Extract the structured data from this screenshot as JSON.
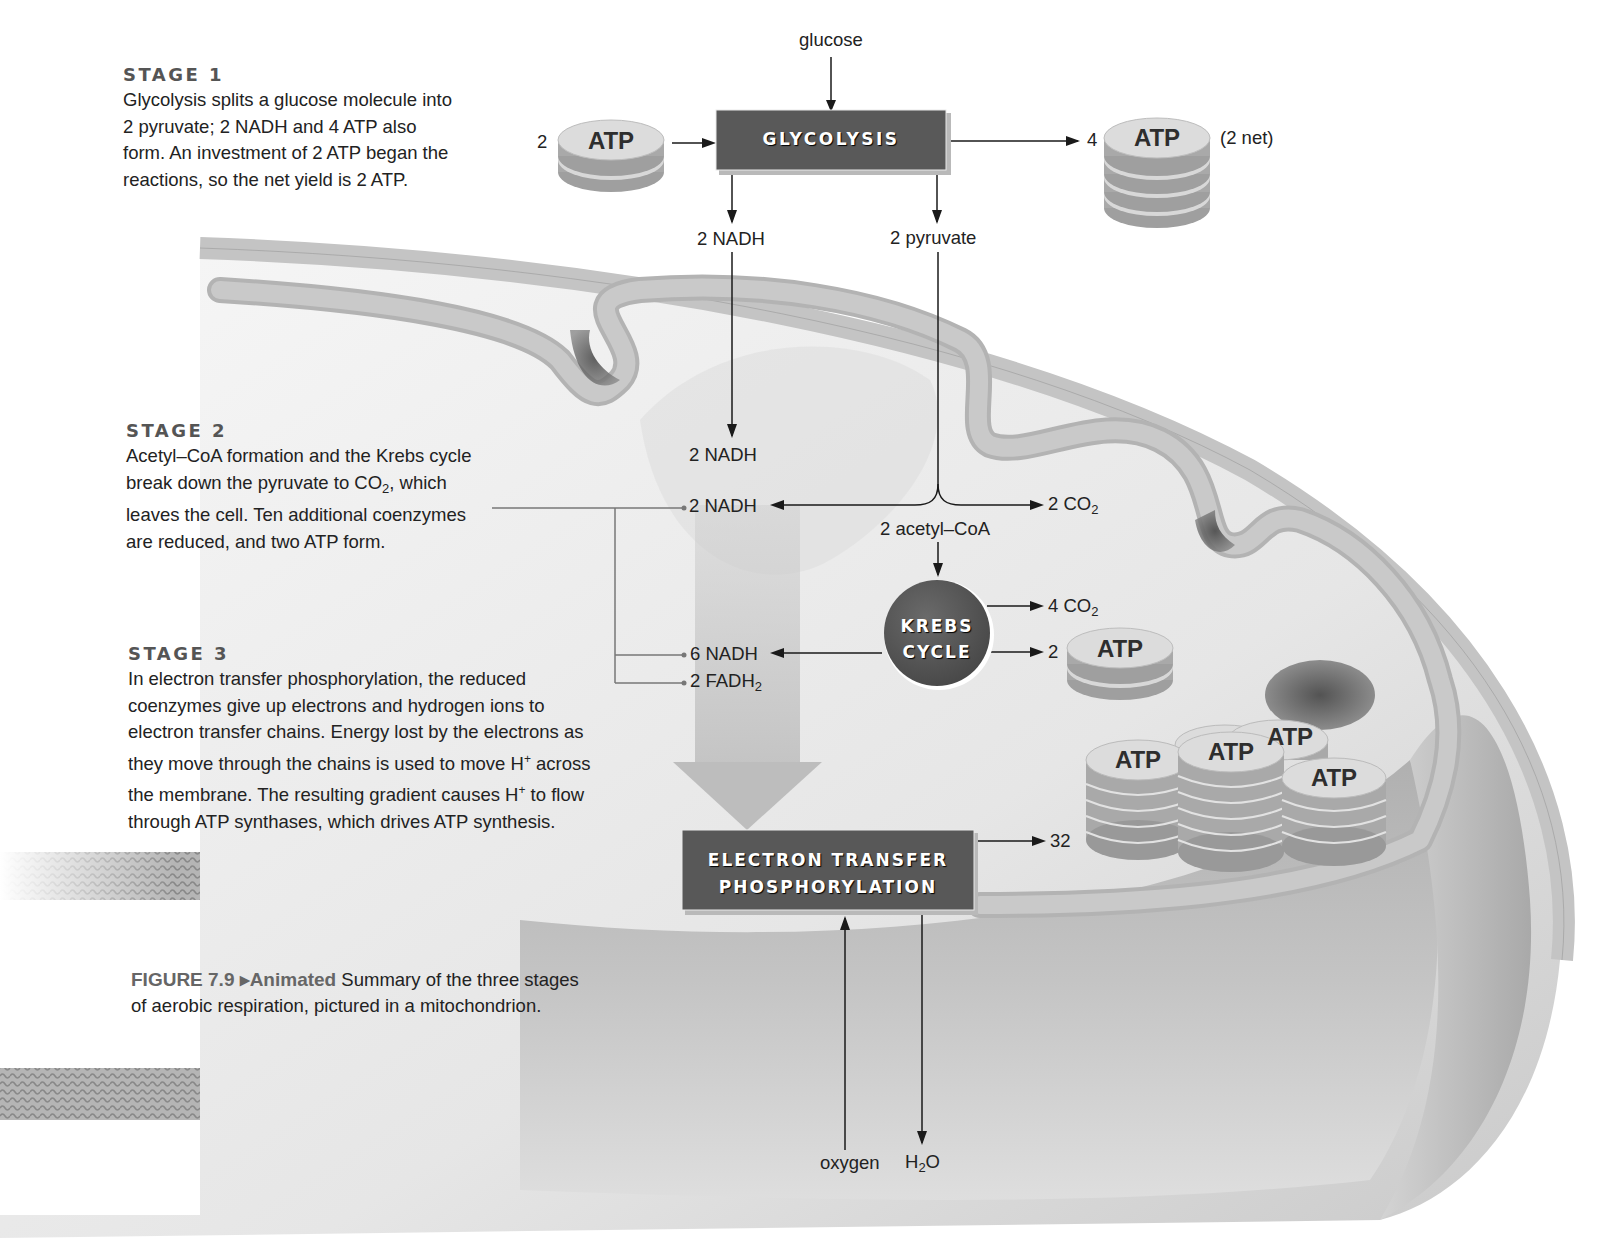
{
  "figure": {
    "caption_label": "FIGURE 7.9",
    "caption_tag": "▸Animated",
    "caption_line1": "Summary of the three stages",
    "caption_line2": "of aerobic respiration, pictured in a mitochondrion."
  },
  "stages": [
    {
      "title": "STAGE 1",
      "lines": [
        "Glycolysis splits a glucose molecule into",
        "2 pyruvate; 2 NADH and 4 ATP also",
        "form. An investment of 2 ATP began the",
        "reactions, so the net yield is 2 ATP."
      ]
    },
    {
      "title": "STAGE 2",
      "lines": [
        "Acetyl–CoA formation and the Krebs cycle",
        "break down the pyruvate to CO",
        "2",
        ", which",
        "leaves the cell. Ten additional coenzymes",
        "are reduced, and two ATP form."
      ]
    },
    {
      "title": "STAGE 3",
      "lines": [
        "In electron transfer phosphorylation, the reduced",
        "coenzymes give up electrons and hydrogen ions to",
        "electron transfer chains. Energy lost by the electrons as",
        "they move through the chains is used to move H",
        "+",
        " across",
        "the membrane. The resulting gradient causes H",
        "+",
        " to flow",
        "through ATP synthases, which drives ATP synthesis."
      ]
    }
  ],
  "processes": {
    "glycolysis": "GLYCOLYSIS",
    "krebs_line1": "KREBS",
    "krebs_line2": "CYCLE",
    "etp_line1": "ELECTRON TRANSFER",
    "etp_line2": "PHOSPHORYLATION"
  },
  "labels": {
    "glucose": "glucose",
    "atp_in_count": "2",
    "atp_out_count": "4",
    "atp_net": "(2 net)",
    "nadh_glycolysis": "2 NADH",
    "pyruvate": "2 pyruvate",
    "nadh_stage1_delivered": "2 NADH",
    "nadh_acetyl": "2 NADH",
    "co2_acetyl_num": "2 CO",
    "co2_acetyl_sub": "2",
    "acetyl_coa": "2 acetyl–CoA",
    "co2_krebs_num": "4 CO",
    "co2_krebs_sub": "2",
    "atp_krebs_count": "2",
    "nadh_krebs": "6 NADH",
    "fadh2_main": "2 FADH",
    "fadh2_sub": "2",
    "atp_etp_count": "32",
    "oxygen": "oxygen",
    "water_h": "H",
    "water_sub": "2",
    "water_o": "O"
  },
  "atp_disc_label": "ATP",
  "colors": {
    "process_box": "#585858",
    "membrane": "#b8b8b8",
    "matrix": "#ececec",
    "atp_top": "#dcdcdc",
    "atp_side": "#a8a8a8",
    "arrow": "#1a1a1a",
    "big_arrow": "#bdbdbd"
  }
}
